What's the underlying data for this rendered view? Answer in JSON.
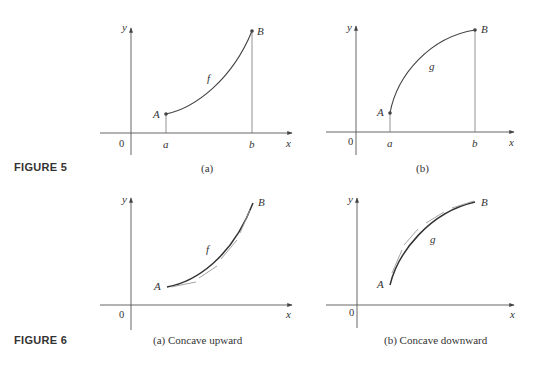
{
  "figure5": {
    "label": "FIGURE 5",
    "panel_a": {
      "caption": "(a)",
      "function_label": "f",
      "point_start": "A",
      "point_end": "B",
      "x_ticks": [
        "a",
        "b"
      ],
      "origin": "0",
      "x_axis": "x",
      "y_axis": "y"
    },
    "panel_b": {
      "caption": "(b)",
      "function_label": "g",
      "point_start": "A",
      "point_end": "B",
      "x_ticks": [
        "a",
        "b"
      ],
      "origin": "0",
      "x_axis": "x",
      "y_axis": "y"
    }
  },
  "figure6": {
    "label": "FIGURE 6",
    "panel_a": {
      "caption": "(a) Concave upward",
      "function_label": "f",
      "point_start": "A",
      "point_end": "B",
      "origin": "0",
      "x_axis": "x",
      "y_axis": "y"
    },
    "panel_b": {
      "caption": "(b) Concave downward",
      "function_label": "g",
      "point_start": "A",
      "point_end": "B",
      "origin": "0",
      "x_axis": "x",
      "y_axis": "y"
    }
  }
}
